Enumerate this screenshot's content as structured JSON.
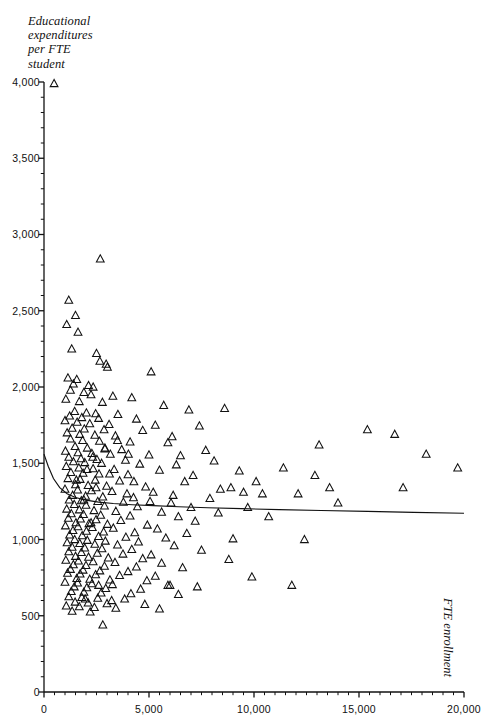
{
  "figure": {
    "top_fragment": "",
    "bottom_fragment": ""
  },
  "axes": {
    "y_title": "Educational\nexpenditures\nper FTE\nstudent",
    "y_title_lines": [
      "Educational",
      "expenditures",
      "per FTE",
      "student"
    ],
    "x_title": "FTE enrollment",
    "y_ticks": [
      "0",
      "500",
      "1,000",
      "1,500",
      "2,000",
      "2,500",
      "3,000",
      "3,500",
      "4,000"
    ],
    "x_ticks": [
      "0",
      "5,000",
      "10,000",
      "15,000",
      "20,000"
    ]
  },
  "chart_data": {
    "type": "scatter",
    "title": "",
    "xlabel": "FTE enrollment",
    "ylabel": "Educational expenditures per FTE student",
    "xlim": [
      0,
      20000
    ],
    "ylim": [
      0,
      4000
    ],
    "x_major_step": 5000,
    "x_minor_step": 500,
    "y_major_step": 500,
    "y_minor_step": 100,
    "grid": false,
    "legend": null,
    "marker": "triangle-up-open",
    "marker_color": "#111111",
    "series": [
      {
        "name": "Institutions",
        "points": [
          [
            480,
            3990
          ],
          [
            2680,
            2840
          ],
          [
            1180,
            2570
          ],
          [
            1500,
            2470
          ],
          [
            1080,
            2410
          ],
          [
            1620,
            2360
          ],
          [
            1320,
            2250
          ],
          [
            2500,
            2220
          ],
          [
            2660,
            2170
          ],
          [
            2960,
            2150
          ],
          [
            3020,
            2130
          ],
          [
            5100,
            2100
          ],
          [
            1140,
            2060
          ],
          [
            1560,
            2050
          ],
          [
            1400,
            2020
          ],
          [
            2120,
            2010
          ],
          [
            2340,
            2000
          ],
          [
            1260,
            1980
          ],
          [
            1900,
            1965
          ],
          [
            2240,
            1950
          ],
          [
            3280,
            1940
          ],
          [
            4180,
            1930
          ],
          [
            1040,
            1920
          ],
          [
            1680,
            1905
          ],
          [
            2780,
            1900
          ],
          [
            5700,
            1880
          ],
          [
            8600,
            1860
          ],
          [
            6900,
            1850
          ],
          [
            1460,
            1840
          ],
          [
            2020,
            1830
          ],
          [
            2460,
            1825
          ],
          [
            3520,
            1820
          ],
          [
            1220,
            1810
          ],
          [
            1800,
            1800
          ],
          [
            2600,
            1795
          ],
          [
            4400,
            1790
          ],
          [
            1000,
            1780
          ],
          [
            1580,
            1770
          ],
          [
            2180,
            1760
          ],
          [
            3100,
            1755
          ],
          [
            5300,
            1750
          ],
          [
            7400,
            1745
          ],
          [
            1340,
            1730
          ],
          [
            1920,
            1725
          ],
          [
            2860,
            1720
          ],
          [
            4700,
            1715
          ],
          [
            15400,
            1720
          ],
          [
            16700,
            1690
          ],
          [
            1100,
            1700
          ],
          [
            1700,
            1690
          ],
          [
            2420,
            1685
          ],
          [
            3400,
            1680
          ],
          [
            6100,
            1675
          ],
          [
            1260,
            1660
          ],
          [
            1840,
            1650
          ],
          [
            2640,
            1645
          ],
          [
            4100,
            1640
          ],
          [
            5900,
            1635
          ],
          [
            13100,
            1620
          ],
          [
            1480,
            1610
          ],
          [
            2060,
            1600
          ],
          [
            2900,
            1595
          ],
          [
            3700,
            1590
          ],
          [
            7700,
            1585
          ],
          [
            1020,
            1580
          ],
          [
            1620,
            1570
          ],
          [
            2280,
            1565
          ],
          [
            3160,
            1560
          ],
          [
            5000,
            1555
          ],
          [
            6500,
            1550
          ],
          [
            18200,
            1560
          ],
          [
            19700,
            1470
          ],
          [
            1180,
            1540
          ],
          [
            1760,
            1530
          ],
          [
            2520,
            1525
          ],
          [
            3880,
            1520
          ],
          [
            8100,
            1515
          ],
          [
            1400,
            1510
          ],
          [
            1940,
            1505
          ],
          [
            2740,
            1500
          ],
          [
            4560,
            1495
          ],
          [
            6300,
            1490
          ],
          [
            11400,
            1470
          ],
          [
            1060,
            1480
          ],
          [
            1660,
            1470
          ],
          [
            2340,
            1465
          ],
          [
            3340,
            1460
          ],
          [
            5500,
            1455
          ],
          [
            9300,
            1450
          ],
          [
            1280,
            1440
          ],
          [
            1860,
            1435
          ],
          [
            2620,
            1430
          ],
          [
            4000,
            1425
          ],
          [
            7100,
            1420
          ],
          [
            12900,
            1420
          ],
          [
            1140,
            1400
          ],
          [
            1720,
            1395
          ],
          [
            2440,
            1390
          ],
          [
            3600,
            1385
          ],
          [
            6700,
            1380
          ],
          [
            10100,
            1380
          ],
          [
            1500,
            1360
          ],
          [
            2100,
            1355
          ],
          [
            2980,
            1350
          ],
          [
            4840,
            1345
          ],
          [
            8900,
            1340
          ],
          [
            1000,
            1330
          ],
          [
            1600,
            1325
          ],
          [
            2260,
            1320
          ],
          [
            3240,
            1315
          ],
          [
            5200,
            1310
          ],
          [
            17100,
            1340
          ],
          [
            1360,
            1290
          ],
          [
            1980,
            1285
          ],
          [
            2800,
            1280
          ],
          [
            4260,
            1275
          ],
          [
            7900,
            1270
          ],
          [
            1200,
            1260
          ],
          [
            1780,
            1255
          ],
          [
            2560,
            1250
          ],
          [
            3780,
            1245
          ],
          [
            6050,
            1240
          ],
          [
            14000,
            1240
          ],
          [
            1440,
            1230
          ],
          [
            2000,
            1225
          ],
          [
            2880,
            1220
          ],
          [
            4450,
            1215
          ],
          [
            9700,
            1210
          ],
          [
            1080,
            1200
          ],
          [
            1680,
            1195
          ],
          [
            2380,
            1190
          ],
          [
            3420,
            1185
          ],
          [
            5600,
            1180
          ],
          [
            8300,
            1175
          ],
          [
            1300,
            1170
          ],
          [
            1880,
            1165
          ],
          [
            2700,
            1160
          ],
          [
            4100,
            1155
          ],
          [
            6400,
            1150
          ],
          [
            10700,
            1150
          ],
          [
            1160,
            1140
          ],
          [
            1740,
            1135
          ],
          [
            2480,
            1130
          ],
          [
            3660,
            1125
          ],
          [
            7200,
            1120
          ],
          [
            1520,
            1110
          ],
          [
            2140,
            1105
          ],
          [
            3020,
            1100
          ],
          [
            4920,
            1095
          ],
          [
            1020,
            1090
          ],
          [
            1620,
            1085
          ],
          [
            2300,
            1080
          ],
          [
            3300,
            1075
          ],
          [
            5400,
            1070
          ],
          [
            1380,
            1060
          ],
          [
            2020,
            1055
          ],
          [
            2840,
            1050
          ],
          [
            4320,
            1045
          ],
          [
            6800,
            1040
          ],
          [
            1220,
            1030
          ],
          [
            1820,
            1025
          ],
          [
            2600,
            1020
          ],
          [
            3900,
            1015
          ],
          [
            5800,
            1010
          ],
          [
            9000,
            1005
          ],
          [
            12400,
            1000
          ],
          [
            1460,
            1000
          ],
          [
            2060,
            995
          ],
          [
            2920,
            990
          ],
          [
            4500,
            985
          ],
          [
            1100,
            980
          ],
          [
            1700,
            975
          ],
          [
            2420,
            970
          ],
          [
            3500,
            965
          ],
          [
            6200,
            960
          ],
          [
            1340,
            950
          ],
          [
            1940,
            945
          ],
          [
            2760,
            940
          ],
          [
            4180,
            935
          ],
          [
            7500,
            930
          ],
          [
            1180,
            920
          ],
          [
            1780,
            915
          ],
          [
            2540,
            910
          ],
          [
            3760,
            905
          ],
          [
            5100,
            900
          ],
          [
            1500,
            890
          ],
          [
            2120,
            885
          ],
          [
            3060,
            880
          ],
          [
            4700,
            875
          ],
          [
            8800,
            870
          ],
          [
            1040,
            865
          ],
          [
            1640,
            860
          ],
          [
            2340,
            855
          ],
          [
            3380,
            850
          ],
          [
            5600,
            845
          ],
          [
            1400,
            835
          ],
          [
            2000,
            830
          ],
          [
            2880,
            825
          ],
          [
            4400,
            820
          ],
          [
            6600,
            815
          ],
          [
            1260,
            805
          ],
          [
            1860,
            800
          ],
          [
            2660,
            795
          ],
          [
            4000,
            790
          ],
          [
            1120,
            780
          ],
          [
            1720,
            775
          ],
          [
            2460,
            770
          ],
          [
            3600,
            765
          ],
          [
            5300,
            760
          ],
          [
            9900,
            755
          ],
          [
            1560,
            745
          ],
          [
            2180,
            740
          ],
          [
            3140,
            735
          ],
          [
            4900,
            730
          ],
          [
            1000,
            720
          ],
          [
            1600,
            715
          ],
          [
            2280,
            710
          ],
          [
            3260,
            705
          ],
          [
            6000,
            700
          ],
          [
            11800,
            700
          ],
          [
            1440,
            690
          ],
          [
            2040,
            685
          ],
          [
            2940,
            680
          ],
          [
            4600,
            675
          ],
          [
            7300,
            690
          ],
          [
            1300,
            660
          ],
          [
            1900,
            655
          ],
          [
            2720,
            650
          ],
          [
            4140,
            645
          ],
          [
            6400,
            640
          ],
          [
            1180,
            625
          ],
          [
            1800,
            620
          ],
          [
            2560,
            615
          ],
          [
            3840,
            610
          ],
          [
            1480,
            590
          ],
          [
            2100,
            585
          ],
          [
            3000,
            580
          ],
          [
            4800,
            575
          ],
          [
            1060,
            565
          ],
          [
            1680,
            560
          ],
          [
            2400,
            555
          ],
          [
            3420,
            550
          ],
          [
            5500,
            545
          ],
          [
            1340,
            530
          ],
          [
            2200,
            525
          ],
          [
            2600,
            700
          ],
          [
            5900,
            700
          ],
          [
            2800,
            440
          ],
          [
            1960,
            610
          ],
          [
            3220,
            600
          ],
          [
            2480,
            1340
          ],
          [
            3950,
            1300
          ],
          [
            2050,
            1460
          ],
          [
            1540,
            1390
          ],
          [
            2320,
            1540
          ],
          [
            3120,
            1430
          ],
          [
            4280,
            1380
          ],
          [
            5050,
            1250
          ],
          [
            6150,
            1290
          ],
          [
            7000,
            1210
          ],
          [
            8400,
            1330
          ],
          [
            9500,
            1310
          ],
          [
            10400,
            1300
          ],
          [
            12100,
            1300
          ],
          [
            13600,
            1340
          ],
          [
            2900,
            1600
          ],
          [
            3500,
            1650
          ],
          [
            4020,
            1560
          ],
          [
            1900,
            1260
          ],
          [
            2240,
            1110
          ]
        ]
      }
    ],
    "fit_curve": {
      "name": "fitted regression curve",
      "points": [
        [
          0,
          1560
        ],
        [
          200,
          1480
        ],
        [
          450,
          1400
        ],
        [
          750,
          1340
        ],
        [
          1100,
          1300
        ],
        [
          1500,
          1275
        ],
        [
          2000,
          1258
        ],
        [
          2600,
          1245
        ],
        [
          3300,
          1236
        ],
        [
          4200,
          1228
        ],
        [
          5200,
          1222
        ],
        [
          6400,
          1215
        ],
        [
          7800,
          1208
        ],
        [
          9400,
          1202
        ],
        [
          11200,
          1196
        ],
        [
          13200,
          1190
        ],
        [
          15400,
          1184
        ],
        [
          17600,
          1178
        ],
        [
          20000,
          1172
        ]
      ]
    }
  }
}
